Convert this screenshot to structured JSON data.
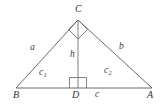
{
  "figure": {
    "background_color": "#ffffff",
    "line_color": "#5a5a5a",
    "label_color": "#3a3a3a",
    "vertices": {
      "B": {
        "label": "B",
        "x": 16,
        "y": 88
      },
      "A": {
        "label": "A",
        "x": 152,
        "y": 88
      },
      "C": {
        "label": "C",
        "x": 78,
        "y": 20
      },
      "D": {
        "label": "D",
        "x": 78,
        "y": 88
      }
    },
    "segments": {
      "left_leg": {
        "label": "a",
        "from": "B",
        "to": "C"
      },
      "right_leg": {
        "label": "b",
        "from": "C",
        "to": "A"
      },
      "altitude": {
        "label": "h",
        "from": "C",
        "to": "D"
      },
      "base_left": {
        "label": "c",
        "sub": "1",
        "from": "B",
        "to": "D"
      },
      "base_right": {
        "label": "c",
        "sub": "2",
        "from": "D",
        "to": "A"
      },
      "base_full": {
        "label": "c",
        "from": "B",
        "to": "A"
      }
    },
    "right_angle_markers": [
      {
        "name": "right-angle-at-c",
        "at": "C",
        "style": "diamond"
      },
      {
        "name": "right-angle-at-d",
        "at": "D",
        "style": "square"
      }
    ],
    "labels": {
      "vertex_c": "C",
      "vertex_b": "B",
      "vertex_a": "A",
      "vertex_d": "D",
      "side_a": "a",
      "side_b": "b",
      "altitude_h": "h",
      "seg_c1_base": "c",
      "seg_c1_sub": "1",
      "seg_c2_base": "c",
      "seg_c2_sub": "2",
      "base_c": "c"
    }
  }
}
